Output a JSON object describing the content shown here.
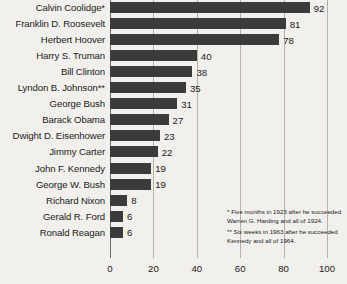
{
  "chart_data": {
    "type": "bar",
    "orientation": "horizontal",
    "title": "",
    "subtitle": "",
    "xlabel": "",
    "ylabel": "",
    "xlim": [
      0,
      100
    ],
    "xticks": [
      "0",
      "20",
      "40",
      "60",
      "80",
      "100"
    ],
    "grid": true,
    "legend": null,
    "categories": [
      "Calvin Coolidge*",
      "Franklin D. Roosevelt",
      "Herbert Hoover",
      "Harry S. Truman",
      "Bill Clinton",
      "Lyndon B. Johnson**",
      "George Bush",
      "Barack Obama",
      "Dwight D. Eisenhower",
      "Jimmy Carter",
      "John F. Kennedy",
      "George W. Bush",
      "Richard Nixon",
      "Gerald R. Ford",
      "Ronald Reagan"
    ],
    "values": [
      92,
      81,
      78,
      40,
      38,
      35,
      31,
      27,
      23,
      22,
      19,
      19,
      8,
      6,
      6
    ],
    "value_labels": [
      "92",
      "81",
      "78",
      "40",
      "38",
      "35",
      "31",
      "27",
      "23",
      "22",
      "19",
      "19",
      "8",
      "6",
      "6"
    ],
    "annotations": [
      "* Five months in 1923 after he succeeded Warren G. Harding and all of 1924.",
      "** Six weeks in 1963 after he succeeded Kennedy and all of 1964."
    ],
    "colors": {
      "bar": "#3b3b3b",
      "background": "#f2f0ed",
      "gridline": "#b4b1ad",
      "axis": "#6f6d6a",
      "text": "#1a1a1a"
    }
  }
}
